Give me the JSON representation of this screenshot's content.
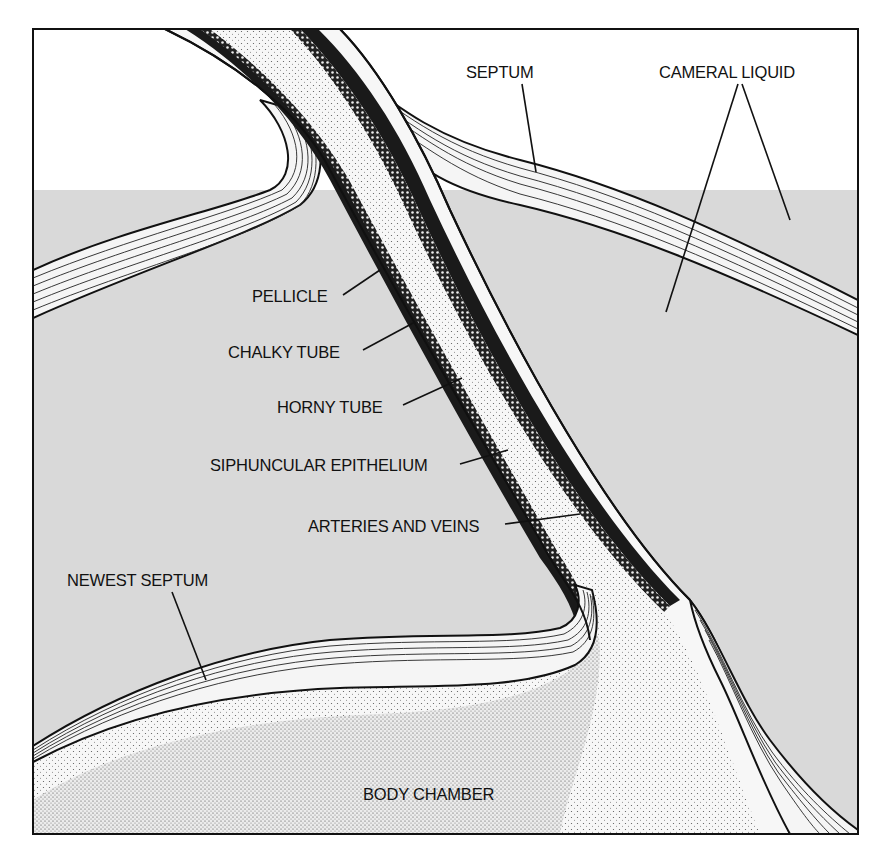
{
  "figure": {
    "type": "cross-section diagram",
    "colors": {
      "background": "#ffffff",
      "cameral_fill": "#d9d9d9",
      "ink": "#111111",
      "siphuncle_fill": "#f4f4f4",
      "body_fill": "#f2f2f2"
    }
  },
  "labels": {
    "septum": "SEPTUM",
    "cameral_liquid": "CAMERAL LIQUID",
    "pellicle": "PELLICLE",
    "chalky_tube": "CHALKY TUBE",
    "horny_tube": "HORNY TUBE",
    "siphuncular_epithelium": "SIPHUNCULAR EPITHELIUM",
    "arteries_and_veins": "ARTERIES AND VEINS",
    "newest_septum": "NEWEST SEPTUM",
    "body_chamber": "BODY CHAMBER"
  }
}
